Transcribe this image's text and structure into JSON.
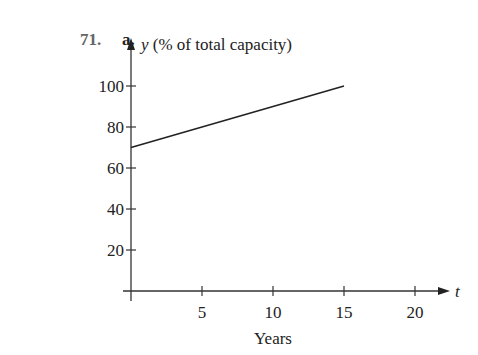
{
  "problem": {
    "number": "71.",
    "part": "a."
  },
  "chart_data": {
    "type": "line",
    "title": "",
    "xlabel": "Years",
    "ylabel": "y (% of total capacity)",
    "x_axis_var": "t",
    "xlim": [
      0,
      22
    ],
    "ylim": [
      0,
      105
    ],
    "x_ticks": [
      5,
      10,
      15,
      20
    ],
    "y_ticks": [
      20,
      40,
      60,
      80,
      100
    ],
    "grid": false,
    "legend": null,
    "series": [
      {
        "name": "capacity",
        "x": [
          0,
          15
        ],
        "y": [
          70,
          100
        ]
      }
    ]
  }
}
